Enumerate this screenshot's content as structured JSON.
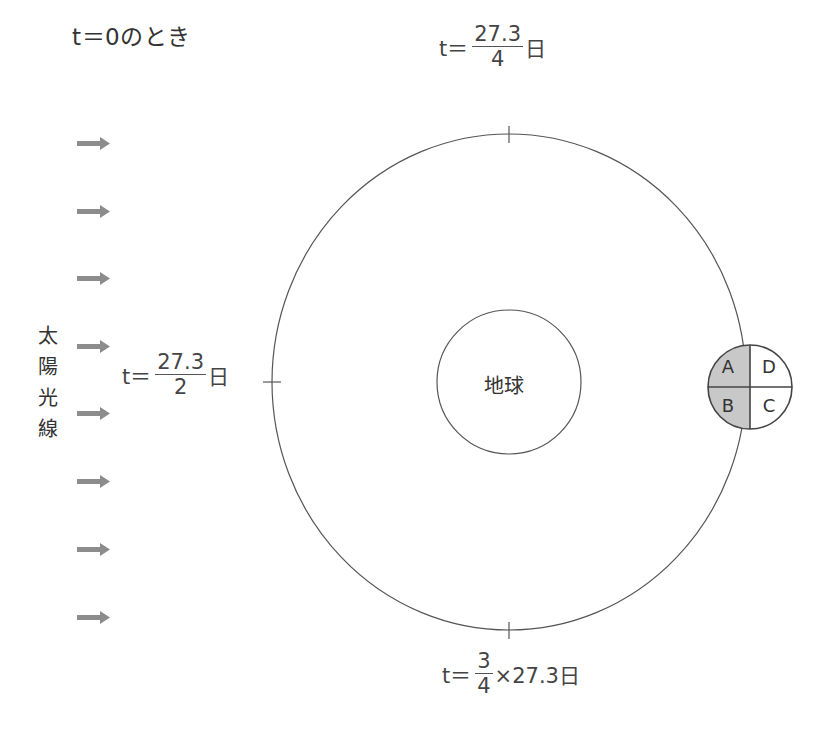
{
  "title": "t＝0のとき",
  "sun_rays": {
    "label_chars": [
      "太",
      "陽",
      "光",
      "線"
    ],
    "arrow_count": 8,
    "arrow_color": "#8c8c8c"
  },
  "earth": {
    "label": "地球"
  },
  "orbit_labels": {
    "top": {
      "prefix": "t＝",
      "numerator": "27.3",
      "denominator": "4",
      "suffix": "日"
    },
    "left": {
      "prefix": "t＝",
      "numerator": "27.3",
      "denominator": "2",
      "suffix": "日"
    },
    "bottom": {
      "prefix": "t＝",
      "numerator": "3",
      "denominator": "4",
      "suffix": "×27.3日"
    }
  },
  "moon": {
    "quadrants": {
      "top_left": "A",
      "bottom_left": "B",
      "bottom_right": "C",
      "top_right": "D"
    },
    "shaded_color": "#c8c8c8"
  },
  "colors": {
    "line": "#555555",
    "text": "#333333"
  }
}
